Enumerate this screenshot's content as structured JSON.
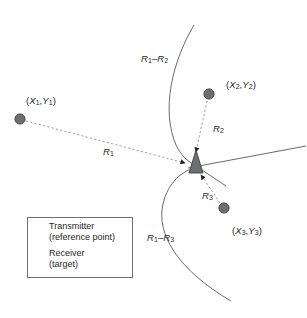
{
  "figure": {
    "width": 307,
    "height": 318,
    "colors": {
      "background": "#ffffff",
      "curve": "#58595b",
      "dashed_ray": "#939598",
      "marker_fill": "#6d6e71",
      "marker_stroke": "#414042",
      "text": "#231f20",
      "legend_border": "#6d6e71"
    }
  },
  "labels": {
    "transmitter1": "(X1,Y1)",
    "transmitter2": "(X2,Y2)",
    "transmitter3": "(X3,Y3)",
    "range1": "R1",
    "range2": "R2",
    "range3": "R3",
    "hyperbola_12": "R1-R2",
    "hyperbola_13": "R1-R3"
  },
  "legend": {
    "items": [
      {
        "marker": "circle-marker",
        "title": "Transmitter",
        "subtitle": "(reference point)"
      },
      {
        "marker": "triangle-marker",
        "title": "Receiver",
        "subtitle": "(target)"
      }
    ]
  },
  "chart_data": {
    "type": "scatter",
    "xlabel": "",
    "ylabel": "",
    "grid": false,
    "legend_position": "bottom-left",
    "points": [
      {
        "name": "Transmitter 1",
        "label": "(X1,Y1)",
        "marker": "circle",
        "x": 20,
        "y": 119
      },
      {
        "name": "Transmitter 2",
        "label": "(X2,Y2)",
        "marker": "circle",
        "x": 209,
        "y": 95
      },
      {
        "name": "Transmitter 3",
        "label": "(X3,Y3)",
        "marker": "circle",
        "x": 224,
        "y": 208
      },
      {
        "name": "Receiver",
        "label": "target",
        "marker": "triangle",
        "x": 196,
        "y": 163
      }
    ],
    "rays": [
      {
        "name": "R1",
        "from": "Transmitter 1",
        "to": "Receiver",
        "style": "dashed-arrow"
      },
      {
        "name": "R2",
        "from": "Transmitter 2",
        "to": "Receiver",
        "style": "dashed-arrow"
      },
      {
        "name": "R3",
        "from": "Transmitter 3",
        "to": "Receiver",
        "style": "dashed-arrow"
      }
    ],
    "curves": [
      {
        "name": "R1-R2",
        "type": "hyperbola-branch",
        "annotation": "R1-R2"
      },
      {
        "name": "R1-R3",
        "type": "hyperbola-branch",
        "annotation": "R1-R3"
      },
      {
        "name": "asymptote-right",
        "type": "line",
        "annotation": ""
      }
    ]
  }
}
